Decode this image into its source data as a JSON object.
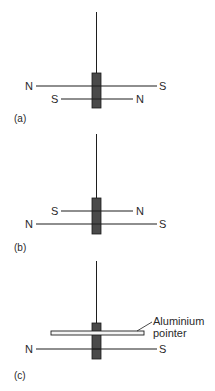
{
  "colors": {
    "line": "#1e1e1e",
    "magnet_fill": "#4a4a4a",
    "magnet_stroke": "#1a1a1a",
    "pointer_fill": "#f4f4f4",
    "background": "#ffffff"
  },
  "panels": [
    {
      "id": "a",
      "caption": "(a)",
      "upper_needle": {
        "left_pole": "N",
        "right_pole": "S"
      },
      "lower_needle": {
        "left_pole": "S",
        "right_pole": "N"
      }
    },
    {
      "id": "b",
      "caption": "(b)",
      "upper_needle": {
        "left_pole": "S",
        "right_pole": "N"
      },
      "lower_needle": {
        "left_pole": "N",
        "right_pole": "S"
      }
    },
    {
      "id": "c",
      "caption": "(c)",
      "pointer_label_line1": "Aluminium",
      "pointer_label_line2": "pointer",
      "lower_needle": {
        "left_pole": "N",
        "right_pole": "S"
      }
    }
  ]
}
